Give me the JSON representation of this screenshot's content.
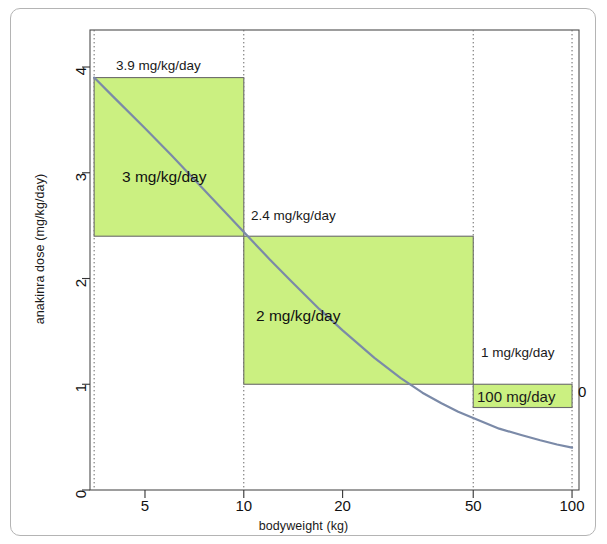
{
  "figure": {
    "frame_border_color": "#b4b4b4",
    "background": "#ffffff"
  },
  "chart_data": {
    "type": "line",
    "title": "",
    "subtitle": "",
    "xlabel": "bodyweight (kg)",
    "ylabel": "anakinra dose (mg/kg/day)",
    "xscale": "log",
    "yscale": "linear",
    "xlim": [
      3.4,
      105
    ],
    "ylim": [
      0,
      4.35
    ],
    "xticks": [
      5,
      10,
      20,
      50,
      100
    ],
    "xtick_labels": [
      "5",
      "10",
      "20",
      "50",
      "100"
    ],
    "yticks": [
      0,
      1,
      2,
      3,
      4
    ],
    "ytick_labels": [
      "0",
      "1",
      "2",
      "3",
      "4"
    ],
    "grid": "vertical dotted gridlines at 3.5, 10, 50, 100 kg",
    "curve": {
      "name": "100 mg/day fixed dose",
      "formula": "dose_mg_per_kg = 100 / bodyweight_kg",
      "color": "#7b8aa8",
      "linewidth": 2.2,
      "x": [
        3.5,
        4,
        5,
        6,
        8,
        10,
        12,
        15,
        20,
        25,
        30,
        40,
        50,
        60,
        70,
        80,
        90,
        100
      ],
      "y": [
        28.57,
        25.0,
        20.0,
        16.67,
        12.5,
        10.0,
        8.33,
        6.67,
        5.0,
        4.0,
        3.33,
        2.5,
        2.0,
        1.67,
        1.43,
        1.25,
        1.11,
        1.0
      ],
      "plotted_x": [
        3.5,
        4,
        5,
        6,
        7,
        8,
        9,
        10,
        12,
        14,
        17,
        20,
        25,
        30,
        35,
        40,
        45,
        50,
        60,
        70,
        80,
        90,
        100
      ],
      "plotted_y": [
        3.9,
        3.72,
        3.42,
        3.17,
        2.95,
        2.76,
        2.59,
        2.44,
        2.18,
        1.97,
        1.71,
        1.51,
        1.25,
        1.06,
        0.92,
        0.82,
        0.74,
        0.68,
        0.58,
        0.52,
        0.47,
        0.43,
        0.4
      ]
    },
    "bands": [
      {
        "label": "3 mg/kg/day",
        "dose_mg_per_kg": 3,
        "x_start": 3.5,
        "x_end": 10,
        "y_bottom": 2.4,
        "y_top": 3.9,
        "fill": "#cbf081",
        "edge": "#6b6b6b"
      },
      {
        "label": "2 mg/kg/day",
        "dose_mg_per_kg": 2,
        "x_start": 10,
        "x_end": 50,
        "y_bottom": 1.0,
        "y_top": 2.4,
        "fill": "#cbf081",
        "edge": "#6b6b6b"
      },
      {
        "label": "100 mg/day",
        "dose_mg_per_kg": 1,
        "x_start": 50,
        "x_end": 100,
        "y_bottom": 0.78,
        "y_top": 1.0,
        "fill": "#cbf081",
        "edge": "#6b6b6b"
      }
    ],
    "annotations": [
      {
        "text": "3.9 mg/kg/day",
        "x": 3.5,
        "y": 3.9,
        "anchor": "left-above"
      },
      {
        "text": "2.4 mg/kg/day",
        "x": 10,
        "y": 2.4,
        "anchor": "left-above"
      },
      {
        "text": "1 mg/kg/day",
        "x": 50,
        "y": 1.0,
        "anchor": "left-above"
      },
      {
        "text": "100 mg/day",
        "x": 50,
        "y": 0.78,
        "anchor": "left-below"
      },
      {
        "text": "0",
        "x": 103,
        "y": 0.82,
        "anchor": "right-outside"
      }
    ]
  }
}
